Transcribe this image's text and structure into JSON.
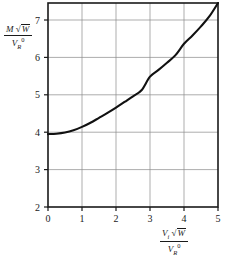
{
  "chart_data": {
    "type": "line",
    "title": "",
    "subtitle": "",
    "xlabel": "Vi sqrt(W) / VR0",
    "ylabel": "M sqrt(W) / VR0",
    "xlabel_parts": {
      "numerator_var": "V",
      "numerator_sub": "i",
      "numerator_radical_sign": "√",
      "numerator_radical_body": "W",
      "denominator_var": "V",
      "denominator_sub": "R",
      "denominator_sup": "0"
    },
    "ylabel_parts": {
      "numerator_var": "M",
      "numerator_radical_sign": "√",
      "numerator_radical_body": "W",
      "denominator_var": "V",
      "denominator_sub": "R",
      "denominator_sup": "0"
    },
    "xlim": [
      0,
      5
    ],
    "ylim": [
      2,
      7.4
    ],
    "xticks": [
      0,
      1,
      2,
      3,
      4,
      5
    ],
    "yticks": [
      2,
      3,
      4,
      5,
      6,
      7
    ],
    "xticklabels": [
      "0",
      "1",
      "2",
      "3",
      "4",
      "5"
    ],
    "yticklabels": [
      "2",
      "3",
      "4",
      "5",
      "6",
      "7"
    ],
    "grid": true,
    "grid_color": "#8a8a8a",
    "legend": null,
    "series": [
      {
        "name": "curve",
        "color": "#111111",
        "x": [
          0.0,
          0.25,
          0.5,
          0.75,
          1.0,
          1.25,
          1.5,
          1.75,
          2.0,
          2.25,
          2.5,
          2.75,
          3.0,
          3.25,
          3.5,
          3.75,
          4.0,
          4.25,
          4.5,
          4.75,
          5.0
        ],
        "y": [
          3.93,
          3.94,
          3.97,
          4.03,
          4.12,
          4.23,
          4.36,
          4.49,
          4.63,
          4.78,
          4.93,
          5.09,
          5.45,
          5.63,
          5.82,
          6.02,
          6.32,
          6.54,
          6.78,
          7.05,
          7.4
        ]
      }
    ]
  },
  "plot": {
    "axis_color": "#1a1a1a",
    "background": "#ffffff"
  }
}
